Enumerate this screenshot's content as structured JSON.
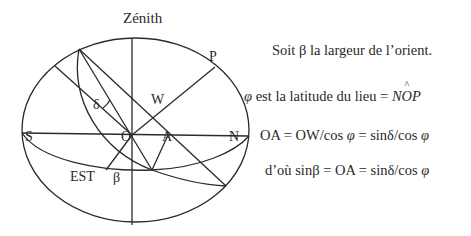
{
  "labels": {
    "zenith": "Zénith",
    "P": "P",
    "W": "W",
    "delta": "δ",
    "S": "S",
    "O": "O",
    "A": "A",
    "N": "N",
    "est": "EST",
    "beta": "β"
  },
  "text_lines": [
    {
      "id": "line1",
      "text": "Soit β la largeur de l’orient."
    },
    {
      "id": "line2",
      "prefix": "φ",
      "text": " est la latitude du lieu = ",
      "formula": "NOP",
      "formula_hat_letter": "O"
    },
    {
      "id": "line3",
      "text": "OA = OW/cos φ = sinδ/cos φ"
    },
    {
      "id": "line4",
      "text": "d’où sinβ = OA = sinδ/cos φ"
    }
  ],
  "line2_parts": {
    "phi": "φ",
    "mid": " est la latitude du lieu = ",
    "N": "N",
    "O": "O",
    "P": "P"
  },
  "line3_parts": {
    "a": "OA = OW/cos ",
    "phi1": "φ",
    "b": " = sinδ/cos ",
    "phi2": "φ"
  },
  "line4_parts": {
    "a": "d’où sinβ = OA = sinδ/cos ",
    "phi": "φ"
  },
  "colors": {
    "stroke": "#2a2a2a",
    "background": "#ffffff"
  }
}
